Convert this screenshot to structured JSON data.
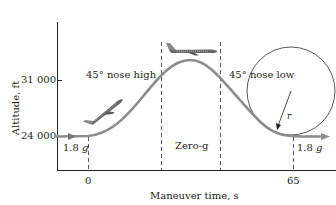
{
  "diagram": {
    "y_axis": {
      "label": "Altitude, ft",
      "ticks": [
        "31 000",
        "24 000"
      ]
    },
    "x_axis": {
      "label": "Maneuver time, s",
      "ticks": [
        "0",
        "65"
      ]
    },
    "annotations": {
      "left_phase": "45° nose high",
      "middle_phase": "Zero-g",
      "right_phase": "45° nose low",
      "left_load": "1.8",
      "right_load": "1.8",
      "g_symbol": "g",
      "radius_symbol": "r"
    },
    "colors": {
      "curve": "#8c8c8c",
      "axis": "#231f20",
      "dashed": "#555555",
      "circle": "#444444",
      "plane": "#6a6a6a"
    }
  }
}
